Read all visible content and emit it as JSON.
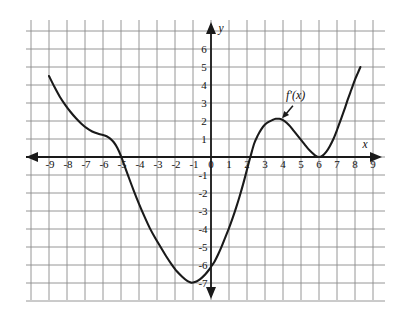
{
  "figure": {
    "kind": "cartesian-graph",
    "background_color": "#ffffff",
    "grid_color": "#8a8a8a",
    "axis_color": "#1a1a1a",
    "curve_color": "#1a1a1a"
  },
  "axes": {
    "x_axis_name": "x",
    "y_axis_name": "y",
    "x_tick_labels": [
      "-9",
      "-8",
      "-7",
      "-6",
      "-5",
      "-4",
      "-3",
      "-2",
      "-1",
      "0",
      "1",
      "2",
      "3",
      "4",
      "5",
      "6",
      "7",
      "8",
      "9"
    ],
    "y_tick_labels_positive": [
      "6",
      "5",
      "4",
      "3",
      "2",
      "1"
    ],
    "y_tick_labels_negative": [
      "-1",
      "-2",
      "-3",
      "-4",
      "-5",
      "-6",
      "-7"
    ],
    "x_min": -10,
    "x_max": 10,
    "y_min": -8,
    "y_max": 7,
    "grid_on": true,
    "grid_step": 1
  },
  "annotations": {
    "curve_label": "f'(x)",
    "curve_label_x": 4.7,
    "curve_label_y": 3.2,
    "pointer_from_x": 4.55,
    "pointer_from_y": 2.85,
    "pointer_to_x": 3.95,
    "pointer_to_y": 2.15
  },
  "chart_data": {
    "type": "line",
    "title": "",
    "xlabel": "x",
    "ylabel": "y",
    "xlim": [
      -10,
      10
    ],
    "ylim": [
      -8,
      7
    ],
    "grid": true,
    "legend": "none",
    "series": [
      {
        "name": "f'(x)",
        "points": [
          [
            -9.0,
            4.5
          ],
          [
            -8.7,
            3.9
          ],
          [
            -8.4,
            3.35
          ],
          [
            -8.1,
            2.9
          ],
          [
            -7.8,
            2.5
          ],
          [
            -7.5,
            2.15
          ],
          [
            -7.2,
            1.85
          ],
          [
            -6.9,
            1.6
          ],
          [
            -6.6,
            1.42
          ],
          [
            -6.3,
            1.3
          ],
          [
            -6.0,
            1.22
          ],
          [
            -5.8,
            1.15
          ],
          [
            -5.6,
            1.02
          ],
          [
            -5.4,
            0.82
          ],
          [
            -5.2,
            0.5
          ],
          [
            -5.0,
            0.05
          ],
          [
            -4.8,
            -0.5
          ],
          [
            -4.6,
            -1.05
          ],
          [
            -4.3,
            -1.85
          ],
          [
            -4.0,
            -2.6
          ],
          [
            -3.7,
            -3.3
          ],
          [
            -3.4,
            -3.95
          ],
          [
            -3.1,
            -4.5
          ],
          [
            -2.8,
            -5.0
          ],
          [
            -2.5,
            -5.5
          ],
          [
            -2.2,
            -5.95
          ],
          [
            -1.9,
            -6.35
          ],
          [
            -1.6,
            -6.65
          ],
          [
            -1.3,
            -6.9
          ],
          [
            -1.1,
            -6.98
          ],
          [
            -0.9,
            -6.95
          ],
          [
            -0.7,
            -6.85
          ],
          [
            -0.5,
            -6.7
          ],
          [
            -0.3,
            -6.5
          ],
          [
            -0.1,
            -6.25
          ],
          [
            0.0,
            -6.1
          ],
          [
            0.2,
            -5.8
          ],
          [
            0.4,
            -5.4
          ],
          [
            0.6,
            -4.95
          ],
          [
            0.8,
            -4.45
          ],
          [
            1.0,
            -3.95
          ],
          [
            1.2,
            -3.4
          ],
          [
            1.4,
            -2.8
          ],
          [
            1.6,
            -2.15
          ],
          [
            1.8,
            -1.45
          ],
          [
            2.0,
            -0.7
          ],
          [
            2.1,
            -0.3
          ],
          [
            2.2,
            0.05
          ],
          [
            2.4,
            0.75
          ],
          [
            2.6,
            1.2
          ],
          [
            2.8,
            1.55
          ],
          [
            3.0,
            1.8
          ],
          [
            3.2,
            1.95
          ],
          [
            3.4,
            2.05
          ],
          [
            3.6,
            2.12
          ],
          [
            3.8,
            2.12
          ],
          [
            4.0,
            2.05
          ],
          [
            4.2,
            1.9
          ],
          [
            4.4,
            1.7
          ],
          [
            4.6,
            1.45
          ],
          [
            4.8,
            1.2
          ],
          [
            5.0,
            0.95
          ],
          [
            5.2,
            0.7
          ],
          [
            5.4,
            0.45
          ],
          [
            5.6,
            0.25
          ],
          [
            5.8,
            0.08
          ],
          [
            6.0,
            0.0
          ],
          [
            6.2,
            0.08
          ],
          [
            6.4,
            0.28
          ],
          [
            6.6,
            0.6
          ],
          [
            6.8,
            1.0
          ],
          [
            7.0,
            1.5
          ],
          [
            7.2,
            2.05
          ],
          [
            7.4,
            2.6
          ],
          [
            7.6,
            3.2
          ],
          [
            7.8,
            3.75
          ],
          [
            8.0,
            4.3
          ],
          [
            8.15,
            4.65
          ],
          [
            8.3,
            5.0
          ]
        ],
        "x_intercepts": [
          -5.0,
          2.1,
          6.0
        ],
        "y_intercept": -6.1,
        "local_max": [
          3.7,
          2.12
        ],
        "local_min": [
          [
            -1.1,
            -7.0
          ],
          [
            6.0,
            0.0
          ]
        ]
      }
    ]
  }
}
